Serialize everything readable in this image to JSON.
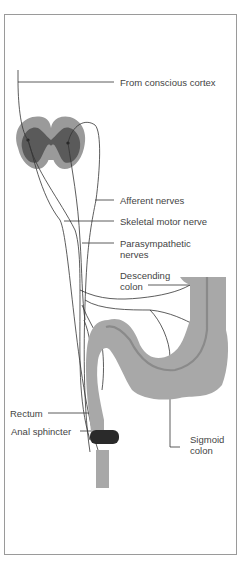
{
  "diagram": {
    "type": "anatomical illustration",
    "labels": {
      "cortex": "From conscious cortex",
      "afferent": "Afferent nerves",
      "skeletal": "Skeletal motor nerve",
      "parasym_1": "Parasympathetic",
      "parasym_2": "nerves",
      "descending_1": "Descending",
      "descending_2": "colon",
      "rectum": "Rectum",
      "sphincter": "Anal sphincter",
      "sigmoid_1": "Sigmoid",
      "sigmoid_2": "colon"
    },
    "colors": {
      "gray_matter": "#5a5a5a",
      "white_matter": "#9a9a9a",
      "colon": "#a8a8a8",
      "colon_lumen": "#8a8a8a",
      "sphincter": "#2a2a2a",
      "nerve_line": "#333333",
      "border": "#9a9a9a",
      "text": "#444444"
    }
  }
}
